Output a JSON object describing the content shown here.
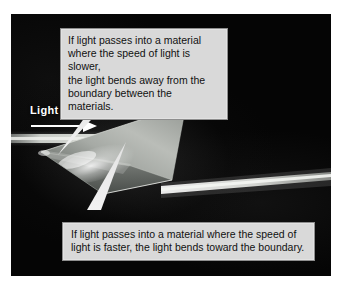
{
  "figure": {
    "kind": "photographic-diagram",
    "page_background": "#ffffff",
    "photo_background": "#050505"
  },
  "labels": {
    "light_in": "Light in"
  },
  "callouts": {
    "top": {
      "text": "If light passes into a material\nwhere the speed of light is slower,\nthe light bends away from the\nboundary between the materials.",
      "lines": [
        "If light passes into a material",
        "where the speed of light is slower,",
        "the light bends away from the",
        "boundary between the materials."
      ],
      "fill": "#d9d9d9",
      "border": "#8e8e8e",
      "text_color": "#111111",
      "points_to": "light-entry-point-on-prism"
    },
    "bottom": {
      "text": "If light passes into a material where the speed of\nlight is faster, the light bends toward the boundary.",
      "lines": [
        "If light passes into a material where the speed of",
        "light is faster, the light bends toward the boundary."
      ],
      "fill": "#d9d9d9",
      "border": "#8e8e8e",
      "text_color": "#111111",
      "points_to": "light-exit-point-on-prism"
    }
  },
  "scene": {
    "prism": {
      "shape": "quadrilateral",
      "fill_light": "#b9bcb8",
      "fill_dark": "#4e524f",
      "edge_highlight": "#e8eae6"
    },
    "incoming_beam": {
      "name": "Light in",
      "color": "#cfd2cc",
      "direction": "left-to-right-horizontal"
    },
    "outgoing_beam": {
      "color": "#d6d8d3",
      "direction": "left-to-right-slightly-upward"
    },
    "arrow": {
      "color": "#ffffff",
      "direction": "right"
    }
  }
}
